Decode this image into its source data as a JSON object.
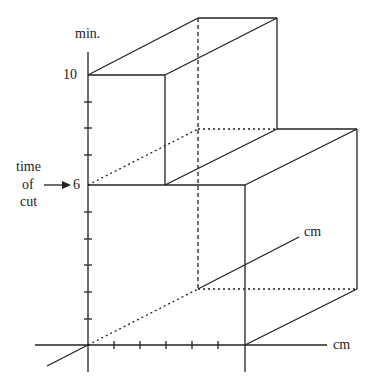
{
  "labels": {
    "y_axis_unit": "min.",
    "y_tick_10": "10",
    "y_tick_6": "6",
    "time_label_1": "time",
    "time_label_2": "of",
    "time_label_3": "cut",
    "depth_axis_unit": "cm",
    "x_axis_unit": "cm"
  },
  "colors": {
    "line": "#222222",
    "background": "#ffffff"
  }
}
